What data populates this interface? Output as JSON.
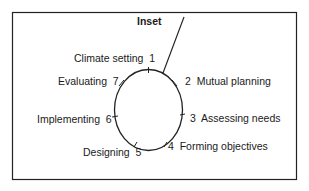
{
  "diagram": {
    "inset_label": "Inset",
    "steps": [
      {
        "num": "1",
        "label": "Climate setting",
        "text": "Climate setting  1"
      },
      {
        "num": "2",
        "label": "Mutual planning",
        "text": "2  Mutual planning"
      },
      {
        "num": "3",
        "label": "Assessing needs",
        "text": "3  Assessing needs"
      },
      {
        "num": "4",
        "label": "Forming objectives",
        "text": "4  Forming objectives"
      },
      {
        "num": "5",
        "label": "Designing",
        "text": "Designing  5"
      },
      {
        "num": "6",
        "label": "Implementing",
        "text": "Implementing  6"
      },
      {
        "num": "7",
        "label": "Evaluating",
        "text": "Evaluating  7"
      }
    ],
    "colors": {
      "stroke": "#222222",
      "background": "#ffffff"
    }
  }
}
